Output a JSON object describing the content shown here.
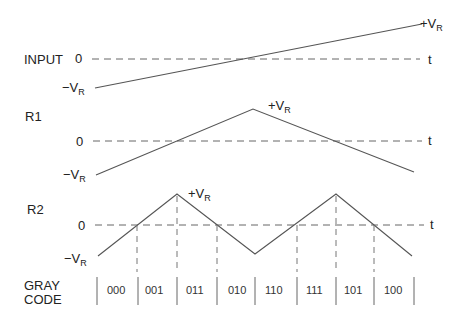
{
  "diagram": {
    "type": "folding-ADC waveforms with Gray code output",
    "signals": [
      {
        "name": "INPUT",
        "zero_label": "0",
        "neg_label_main": "−V",
        "neg_label_sub": "R",
        "pos_label_main": "+V",
        "pos_label_sub": "R",
        "axis_label": "t",
        "shape": "ramp from -VR to +VR"
      },
      {
        "name": "R1",
        "zero_label": "0",
        "neg_label_main": "−V",
        "neg_label_sub": "R",
        "pos_label_main": "+V",
        "pos_label_sub": "R",
        "axis_label": "t",
        "shape": "single triangle fold"
      },
      {
        "name": "R2",
        "zero_label": "0",
        "neg_label_main": "−V",
        "neg_label_sub": "R",
        "pos_label_main": "+V",
        "pos_label_sub": "R",
        "axis_label": "t",
        "shape": "double triangle fold"
      }
    ],
    "gray_code": {
      "label_line1": "GRAY",
      "label_line2": "CODE",
      "codes": [
        "000",
        "001",
        "011",
        "010",
        "110",
        "111",
        "101",
        "100"
      ]
    }
  }
}
